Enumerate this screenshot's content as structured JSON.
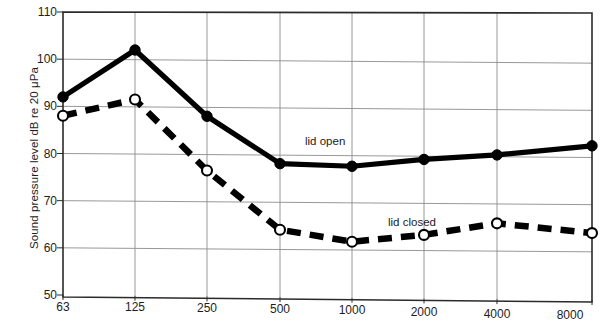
{
  "chart_data": {
    "type": "line",
    "title": "",
    "subtitle": "",
    "xlabel": "",
    "ylabel": "Sound pressure level dB re 20 μPa",
    "x": [
      63,
      125,
      250,
      500,
      1000,
      2000,
      4000,
      8000
    ],
    "xtick_labels": [
      "63",
      "125",
      "250",
      "500",
      "1000",
      "2000",
      "4000",
      "8000"
    ],
    "xscale": "octave-band (logarithmic)",
    "ytick_labels": [
      "50",
      "60",
      "70",
      "80",
      "90",
      "100",
      "110"
    ],
    "ytick_values": [
      50,
      60,
      70,
      80,
      90,
      100,
      110
    ],
    "ylim": [
      50,
      110
    ],
    "grid": true,
    "legend_position": "inline-annotations",
    "series": [
      {
        "name": "lid open",
        "marker": "filled-circle",
        "linestyle": "solid",
        "color": "#000000",
        "values": [
          92,
          102,
          88,
          78,
          77.5,
          79,
          80,
          82
        ]
      },
      {
        "name": "lid closed",
        "marker": "open-circle",
        "linestyle": "dashed",
        "color": "#000000",
        "values": [
          88,
          91.5,
          76.5,
          64,
          61.5,
          63,
          65.5,
          63.5
        ]
      }
    ],
    "annotations": [
      {
        "text": "lid open",
        "x": 500,
        "y": 80.5
      },
      {
        "text": "lid closed",
        "x": 2000,
        "y": 66.5
      }
    ]
  },
  "axes": {
    "border_color": "#2b2b2b",
    "grid_color": "#8c8c8c"
  }
}
